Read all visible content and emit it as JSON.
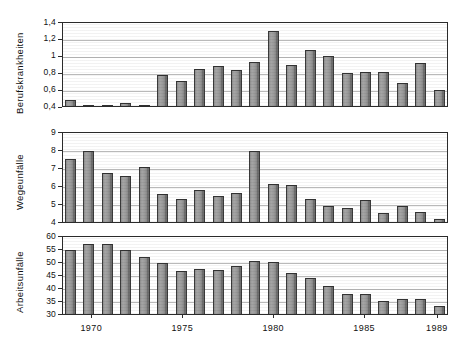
{
  "figure": {
    "background": "#ffffff",
    "bar_color": "#9d9d9d",
    "bar_edge_color": "#333333",
    "grid_color": "#b9b9b9",
    "axis_color": "#2b2b2b"
  },
  "x_axis": {
    "tick_labels": [
      "1970",
      "1975",
      "1980",
      "1985",
      "1989"
    ],
    "tick_years": [
      1970,
      1975,
      1980,
      1985,
      1989
    ],
    "years": [
      1969,
      1970,
      1971,
      1972,
      1973,
      1974,
      1975,
      1976,
      1977,
      1978,
      1979,
      1980,
      1981,
      1982,
      1983,
      1984,
      1985,
      1986,
      1987,
      1988,
      1989
    ]
  },
  "panels": [
    {
      "id": "berufskrankheiten",
      "ylabel": "Berufskrankheiten",
      "y_ticks": [
        "1,4",
        "1,2",
        "1",
        "0,8",
        "0,6",
        "0,4"
      ],
      "ylim": [
        0.4,
        1.4
      ]
    },
    {
      "id": "wegeunfaelle",
      "ylabel": "Wegeunfälle",
      "y_ticks": [
        "9",
        "8",
        "7",
        "6",
        "5",
        "4"
      ],
      "ylim": [
        4,
        9
      ]
    },
    {
      "id": "arbeitsunfaelle",
      "ylabel": "Arbeitsunfälle",
      "y_ticks": [
        "60",
        "55",
        "50",
        "45",
        "40",
        "35",
        "30"
      ],
      "ylim": [
        30,
        60
      ]
    }
  ],
  "chart_data": [
    {
      "type": "bar",
      "title": "Berufskrankheiten",
      "xlabel": "",
      "ylabel": "Berufskrankheiten",
      "ylim": [
        0.4,
        1.4
      ],
      "grid": true,
      "legend": "none",
      "categories": [
        "1969",
        "1970",
        "1971",
        "1972",
        "1973",
        "1974",
        "1975",
        "1976",
        "1977",
        "1978",
        "1979",
        "1980",
        "1981",
        "1982",
        "1983",
        "1984",
        "1985",
        "1986",
        "1987",
        "1988",
        "1989"
      ],
      "values": [
        0.47,
        0.38,
        0.4,
        0.44,
        0.38,
        0.78,
        0.71,
        0.86,
        0.9,
        0.84,
        0.94,
        1.33,
        0.91,
        1.09,
        1.02,
        0.81,
        0.82,
        0.82,
        0.68,
        0.93,
        0.6
      ]
    },
    {
      "type": "bar",
      "title": "Wegeunfälle",
      "xlabel": "",
      "ylabel": "Wegeunfälle",
      "ylim": [
        4,
        9
      ],
      "grid": true,
      "legend": "none",
      "categories": [
        "1969",
        "1970",
        "1971",
        "1972",
        "1973",
        "1974",
        "1975",
        "1976",
        "1977",
        "1978",
        "1979",
        "1980",
        "1981",
        "1982",
        "1983",
        "1984",
        "1985",
        "1986",
        "1987",
        "1988",
        "1989"
      ],
      "values": [
        7.6,
        8.1,
        6.8,
        6.65,
        7.15,
        5.6,
        5.35,
        5.85,
        5.5,
        5.65,
        8.1,
        6.2,
        6.15,
        5.3,
        4.9,
        4.8,
        5.25,
        4.5,
        4.9,
        4.55,
        4.2
      ]
    },
    {
      "type": "bar",
      "title": "Arbeitsunfälle",
      "xlabel": "",
      "ylabel": "Arbeitsunfälle",
      "ylim": [
        30,
        60
      ],
      "grid": true,
      "legend": "none",
      "categories": [
        "1969",
        "1970",
        "1971",
        "1972",
        "1973",
        "1974",
        "1975",
        "1976",
        "1977",
        "1978",
        "1979",
        "1980",
        "1981",
        "1982",
        "1983",
        "1984",
        "1985",
        "1986",
        "1987",
        "1988",
        "1989"
      ],
      "values": [
        55.5,
        58.0,
        58.2,
        55.5,
        52.7,
        50.6,
        47.4,
        48.1,
        47.6,
        49.2,
        51.1,
        50.7,
        46.5,
        44.3,
        41.1,
        38.2,
        38.2,
        35.1,
        36.1,
        36.0,
        33.2
      ]
    }
  ]
}
